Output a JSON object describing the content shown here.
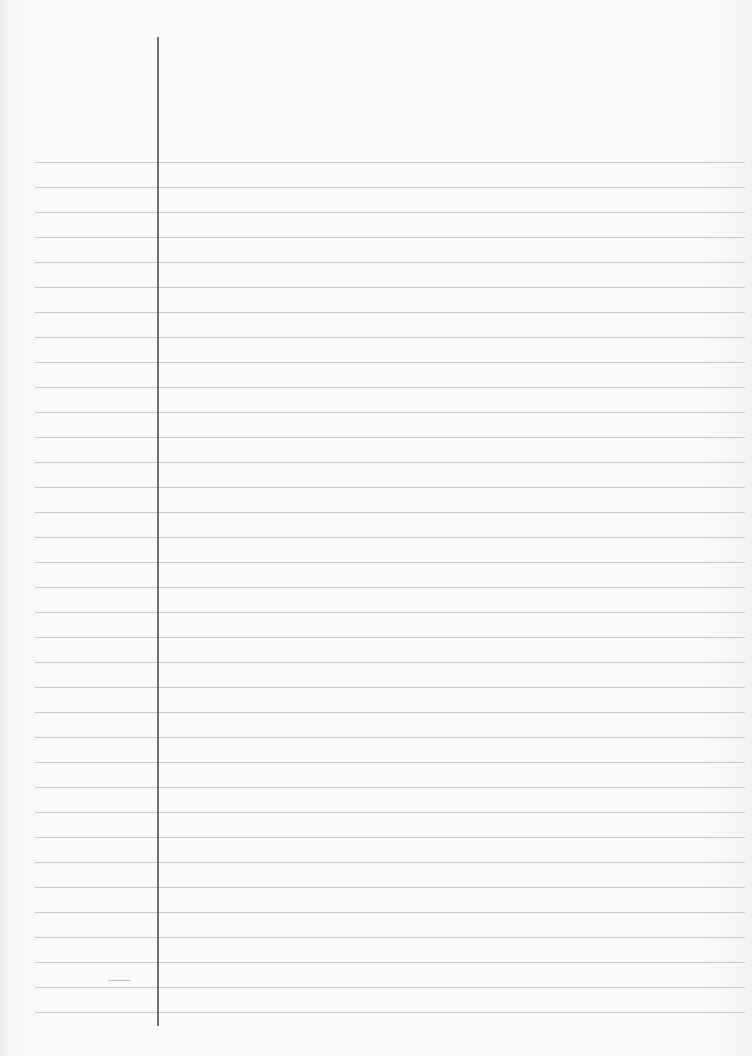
{
  "page": {
    "type": "lined-paper",
    "background_color": "#fafaf9",
    "rule_color": "#c9c9c9",
    "margin_line_color": "#6e6e6e",
    "rules": {
      "count": 35,
      "first_y": 162,
      "spacing": 25,
      "left_x": 35,
      "right_x": 745
    },
    "margin_line": {
      "x": 157,
      "top_y": 37,
      "bottom_y": 1026
    }
  }
}
